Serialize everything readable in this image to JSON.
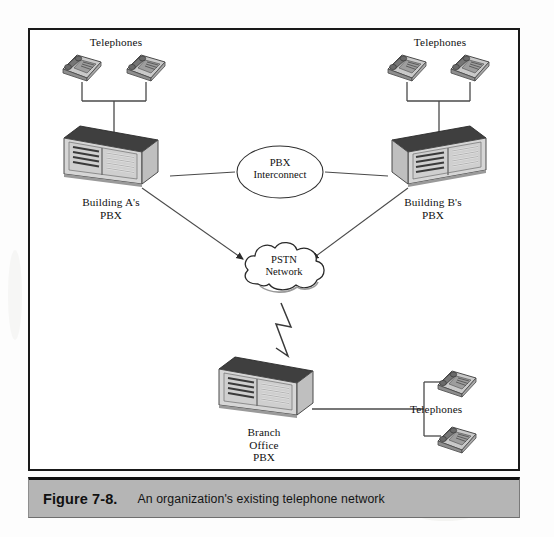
{
  "figure": {
    "caption_number": "Figure 7-8.",
    "caption_text": "An organization's existing telephone network"
  },
  "nodes": {
    "telephones_top_left_label": "Telephones",
    "telephones_top_right_label": "Telephones",
    "telephones_bottom_right_label": "Telephones",
    "pbx_a_label": "Building A's\nPBX",
    "pbx_b_label": "Building B's\nPBX",
    "pbx_branch_label": "Branch\nOffice\nPBX",
    "interconnect_line1": "PBX",
    "interconnect_line2": "Interconnect",
    "pstn_line1": "PSTN",
    "pstn_line2": "Network"
  },
  "colors": {
    "frame_border": "#1a1a1a",
    "caption_background": "#b5b5b5",
    "line": "#3a3a3a",
    "cabinet_face": "#d8d8d8",
    "cabinet_top": "#4a4a4a",
    "cabinet_side": "#c3c3c3",
    "phone_body": "#b9b9b9",
    "page_background": "#ffffff"
  }
}
